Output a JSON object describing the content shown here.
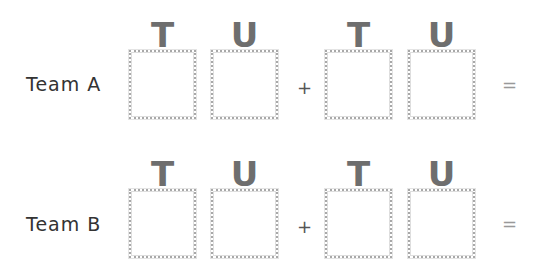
{
  "rows": [
    {
      "team": "Team A",
      "headers": [
        "T",
        "U",
        "T",
        "U"
      ],
      "operator": "+",
      "equals": "="
    },
    {
      "team": "Team B",
      "headers": [
        "T",
        "U",
        "T",
        "U"
      ],
      "operator": "+",
      "equals": "="
    }
  ]
}
